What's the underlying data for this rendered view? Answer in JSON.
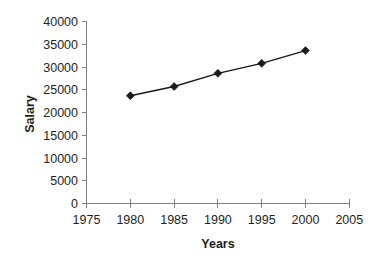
{
  "chart_data": {
    "type": "line",
    "title": "",
    "subtitle": "",
    "xlabel": "Years",
    "ylabel": "Salary",
    "x": [
      1980,
      1985,
      1990,
      1995,
      2000
    ],
    "values": [
      23700,
      25700,
      28600,
      30800,
      33600
    ],
    "series": [
      {
        "name": "Salary",
        "x": [
          1980,
          1985,
          1990,
          1995,
          2000
        ],
        "values": [
          23700,
          25700,
          28600,
          30800,
          33600
        ]
      }
    ],
    "xlim": [
      1975,
      2005
    ],
    "ylim": [
      0,
      40000
    ],
    "xticks": [
      1975,
      1980,
      1985,
      1990,
      1995,
      2000,
      2005
    ],
    "yticks": [
      0,
      5000,
      10000,
      15000,
      20000,
      25000,
      30000,
      35000,
      40000
    ],
    "xtick_labels": [
      "1975",
      "1980",
      "1985",
      "1990",
      "1995",
      "2000",
      "2005"
    ],
    "ytick_labels": [
      "0",
      "5000",
      "10000",
      "15000",
      "20000",
      "25000",
      "30000",
      "35000",
      "40000"
    ],
    "grid": false,
    "legend": false,
    "legend_position": "none",
    "marker": "diamond",
    "line_color": "#1a1a1a",
    "marker_color": "#1a1a1a",
    "axis_color": "#808080",
    "background_color": "#ffffff",
    "annotations": []
  },
  "axes": {
    "y_title": "Salary",
    "x_title": "Years"
  },
  "ytick_labels": {
    "t0": "40000",
    "t1": "35000",
    "t2": "30000",
    "t3": "25000",
    "t4": "20000",
    "t5": "15000",
    "t6": "10000",
    "t7": "5000",
    "t8": "0"
  },
  "xtick_labels": {
    "t0": "1975",
    "t1": "1980",
    "t2": "1985",
    "t3": "1990",
    "t4": "1995",
    "t5": "2000",
    "t6": "2005"
  }
}
